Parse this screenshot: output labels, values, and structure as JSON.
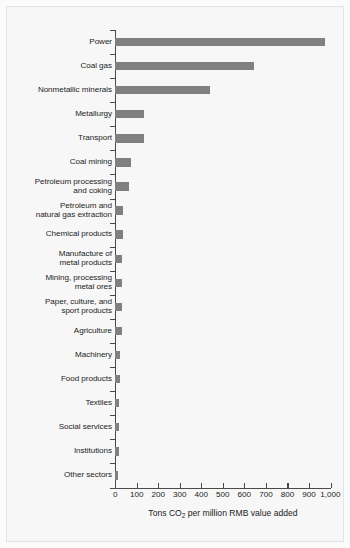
{
  "chart_data": {
    "type": "bar",
    "orientation": "horizontal",
    "title": "",
    "xlabel": "Tons CO2 per million RMB value added",
    "xlabel_parts": {
      "pre": "Tons CO",
      "sub": "2",
      "post": " per million RMB value added"
    },
    "ylabel": "",
    "xlim": [
      0,
      1000
    ],
    "xticks": [
      0,
      100,
      200,
      300,
      400,
      500,
      600,
      700,
      800,
      900,
      1000
    ],
    "xticklabels": [
      "0",
      "100",
      "200",
      "300",
      "400",
      "500",
      "600",
      "700",
      "800",
      "900",
      "1,000"
    ],
    "grid": false,
    "legend": false,
    "bar_color": "#808080",
    "background_color": "#f7f7f7",
    "categories": [
      "Power",
      "Coal gas",
      "Nonmetallic minerals",
      "Metallurgy",
      "Transport",
      "Coal mining",
      "Petroleum processing\nand coking",
      "Petroleum and\nnatural gas extraction",
      "Chemical products",
      "Manufacture of\nmetal products",
      "Mining, processing\nmetal ores",
      "Paper, culture, and\nsport products",
      "Agriculture",
      "Machinery",
      "Food products",
      "Textiles",
      "Social services",
      "Institutions",
      "Other sectors"
    ],
    "values": [
      974,
      644,
      439,
      133,
      133,
      74,
      66,
      36,
      36,
      32,
      30,
      30,
      30,
      23,
      21,
      18,
      18,
      16,
      14
    ]
  }
}
